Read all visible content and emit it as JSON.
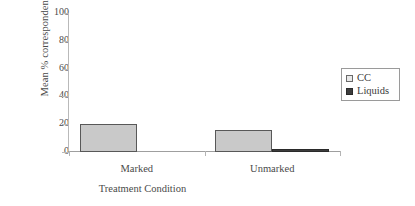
{
  "chart_data": {
    "type": "bar",
    "title": "",
    "xlabel": "Treatment Condition",
    "ylabel": "Mean % correspondence",
    "categories": [
      "Marked",
      "Unmarked"
    ],
    "series": [
      {
        "name": "CC",
        "values": [
          20,
          16
        ],
        "color": "#c9c9c9"
      },
      {
        "name": "Liquids",
        "values": [
          0,
          2
        ],
        "color": "#3d3d3d"
      }
    ],
    "ylim": [
      0,
      100
    ],
    "yticks": [
      0,
      20,
      40,
      60,
      80,
      100
    ],
    "ytick_labels": [
      "0",
      "20",
      "40",
      "60",
      "80",
      "100"
    ],
    "grid": false,
    "legend_position": "right"
  },
  "legend": {
    "items": [
      {
        "label": "CC",
        "swatch": "cc-swatch-icon"
      },
      {
        "label": "Liquids",
        "swatch": "liquids-swatch-icon"
      }
    ]
  }
}
